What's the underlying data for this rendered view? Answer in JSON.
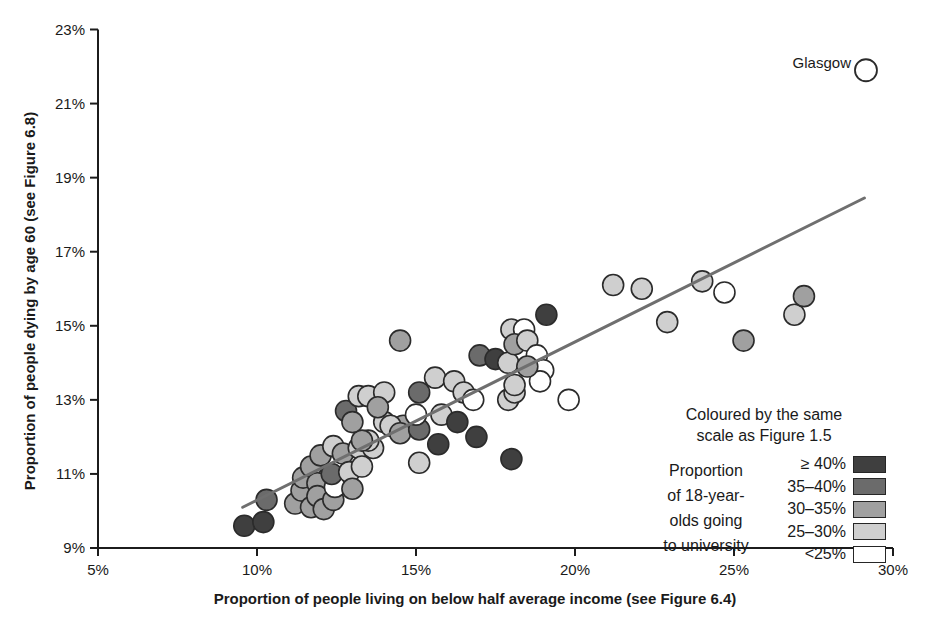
{
  "chart_data": {
    "type": "scatter",
    "xlabel": "Proportion of people living on below half average income (see Figure 6.4)",
    "ylabel": "Proportion of people dying by age 60 (see Figure 6.8)",
    "xlim": [
      5,
      30
    ],
    "ylim": [
      9,
      23
    ],
    "grid": false,
    "x_ticks": [
      5,
      10,
      15,
      20,
      25,
      30
    ],
    "x_tick_labels": [
      "5%",
      "10%",
      "15%",
      "20%",
      "25%",
      "30%"
    ],
    "y_ticks": [
      9,
      11,
      13,
      15,
      17,
      19,
      21,
      23
    ],
    "y_tick_labels": [
      "9%",
      "11%",
      "13%",
      "15%",
      "17%",
      "19%",
      "21%",
      "23%"
    ],
    "axis_color": "#1c1c1c",
    "point_outline_color": "#2b2b2b",
    "trend_line": {
      "x1": 9.55,
      "y1": 10.1,
      "x2": 29.1,
      "y2": 18.45,
      "color": "#6f6f6f"
    },
    "annotation": {
      "label": "Glasgow",
      "x": 29.15,
      "y": 21.9,
      "category": "lt25"
    },
    "legend": {
      "title_line1": "Coloured by the same",
      "title_line2": "scale as Figure 1.5",
      "side_label_lines": [
        "Proportion",
        "of 18-year-",
        "olds going",
        "to university"
      ]
    },
    "categories": [
      {
        "id": "ge40",
        "label": "≥ 40%",
        "color": "#3f3f3f"
      },
      {
        "id": "35-40",
        "label": "35–40%",
        "color": "#6b6b6b"
      },
      {
        "id": "30-35",
        "label": "30–35%",
        "color": "#a0a0a0"
      },
      {
        "id": "25-30",
        "label": "25–30%",
        "color": "#cfcfcf"
      },
      {
        "id": "lt25",
        "label": "<25%",
        "color": "#ffffff"
      }
    ],
    "points": [
      {
        "x": 9.6,
        "y": 9.6,
        "c": "ge40"
      },
      {
        "x": 10.2,
        "y": 9.7,
        "c": "ge40"
      },
      {
        "x": 10.3,
        "y": 10.3,
        "c": "35-40"
      },
      {
        "x": 11.2,
        "y": 10.2,
        "c": "30-35"
      },
      {
        "x": 11.4,
        "y": 10.55,
        "c": "30-35"
      },
      {
        "x": 11.45,
        "y": 10.9,
        "c": "30-35"
      },
      {
        "x": 11.7,
        "y": 10.1,
        "c": "30-35"
      },
      {
        "x": 11.7,
        "y": 11.2,
        "c": "30-35"
      },
      {
        "x": 11.9,
        "y": 10.75,
        "c": "30-35"
      },
      {
        "x": 11.9,
        "y": 10.4,
        "c": "30-35"
      },
      {
        "x": 12.1,
        "y": 10.05,
        "c": "30-35"
      },
      {
        "x": 12.4,
        "y": 10.3,
        "c": "30-35"
      },
      {
        "x": 12.45,
        "y": 10.65,
        "c": "lt25"
      },
      {
        "x": 12.35,
        "y": 11.0,
        "c": "35-40"
      },
      {
        "x": 12.0,
        "y": 11.5,
        "c": "30-35"
      },
      {
        "x": 12.4,
        "y": 11.75,
        "c": "25-30"
      },
      {
        "x": 12.7,
        "y": 11.55,
        "c": "30-35"
      },
      {
        "x": 12.9,
        "y": 11.05,
        "c": "25-30"
      },
      {
        "x": 13.0,
        "y": 10.6,
        "c": "30-35"
      },
      {
        "x": 13.2,
        "y": 11.7,
        "c": "25-30"
      },
      {
        "x": 13.3,
        "y": 11.2,
        "c": "25-30"
      },
      {
        "x": 13.65,
        "y": 11.7,
        "c": "25-30"
      },
      {
        "x": 13.5,
        "y": 11.9,
        "c": "25-30"
      },
      {
        "x": 13.3,
        "y": 11.9,
        "c": "30-35"
      },
      {
        "x": 14.0,
        "y": 12.4,
        "c": "25-30"
      },
      {
        "x": 14.6,
        "y": 12.3,
        "c": "30-35"
      },
      {
        "x": 15.1,
        "y": 11.3,
        "c": "25-30"
      },
      {
        "x": 12.8,
        "y": 12.7,
        "c": "35-40"
      },
      {
        "x": 13.0,
        "y": 12.4,
        "c": "30-35"
      },
      {
        "x": 13.2,
        "y": 13.1,
        "c": "25-30"
      },
      {
        "x": 13.5,
        "y": 13.1,
        "c": "25-30"
      },
      {
        "x": 14.0,
        "y": 13.2,
        "c": "25-30"
      },
      {
        "x": 13.8,
        "y": 12.8,
        "c": "30-35"
      },
      {
        "x": 14.2,
        "y": 12.3,
        "c": "25-30"
      },
      {
        "x": 14.5,
        "y": 14.6,
        "c": "30-35"
      },
      {
        "x": 15.1,
        "y": 13.2,
        "c": "35-40"
      },
      {
        "x": 14.5,
        "y": 12.1,
        "c": "30-35"
      },
      {
        "x": 15.1,
        "y": 12.2,
        "c": "35-40"
      },
      {
        "x": 15.0,
        "y": 12.6,
        "c": "lt25"
      },
      {
        "x": 15.6,
        "y": 13.6,
        "c": "25-30"
      },
      {
        "x": 15.8,
        "y": 12.6,
        "c": "25-30"
      },
      {
        "x": 15.7,
        "y": 11.8,
        "c": "ge40"
      },
      {
        "x": 16.3,
        "y": 12.4,
        "c": "ge40"
      },
      {
        "x": 16.2,
        "y": 13.5,
        "c": "25-30"
      },
      {
        "x": 16.5,
        "y": 13.2,
        "c": "25-30"
      },
      {
        "x": 16.8,
        "y": 13.0,
        "c": "lt25"
      },
      {
        "x": 16.9,
        "y": 12.0,
        "c": "ge40"
      },
      {
        "x": 17.0,
        "y": 14.2,
        "c": "35-40"
      },
      {
        "x": 17.5,
        "y": 14.1,
        "c": "ge40"
      },
      {
        "x": 17.9,
        "y": 14.0,
        "c": "25-30"
      },
      {
        "x": 17.9,
        "y": 13.0,
        "c": "25-30"
      },
      {
        "x": 18.1,
        "y": 13.2,
        "c": "25-30"
      },
      {
        "x": 18.0,
        "y": 11.4,
        "c": "ge40"
      },
      {
        "x": 18.0,
        "y": 14.9,
        "c": "25-30"
      },
      {
        "x": 18.4,
        "y": 14.9,
        "c": "lt25"
      },
      {
        "x": 18.1,
        "y": 14.5,
        "c": "30-35"
      },
      {
        "x": 18.5,
        "y": 14.6,
        "c": "25-30"
      },
      {
        "x": 19.1,
        "y": 15.3,
        "c": "ge40"
      },
      {
        "x": 18.8,
        "y": 14.2,
        "c": "lt25"
      },
      {
        "x": 19.0,
        "y": 13.8,
        "c": "lt25"
      },
      {
        "x": 18.9,
        "y": 13.5,
        "c": "lt25"
      },
      {
        "x": 18.5,
        "y": 13.9,
        "c": "30-35"
      },
      {
        "x": 18.1,
        "y": 13.4,
        "c": "25-30"
      },
      {
        "x": 19.8,
        "y": 13.0,
        "c": "lt25"
      },
      {
        "x": 21.2,
        "y": 16.1,
        "c": "25-30"
      },
      {
        "x": 22.1,
        "y": 16.0,
        "c": "25-30"
      },
      {
        "x": 22.9,
        "y": 15.1,
        "c": "25-30"
      },
      {
        "x": 24.0,
        "y": 16.2,
        "c": "25-30"
      },
      {
        "x": 24.7,
        "y": 15.9,
        "c": "lt25"
      },
      {
        "x": 25.3,
        "y": 14.6,
        "c": "30-35"
      },
      {
        "x": 26.9,
        "y": 15.3,
        "c": "25-30"
      },
      {
        "x": 27.2,
        "y": 15.8,
        "c": "30-35"
      }
    ]
  }
}
